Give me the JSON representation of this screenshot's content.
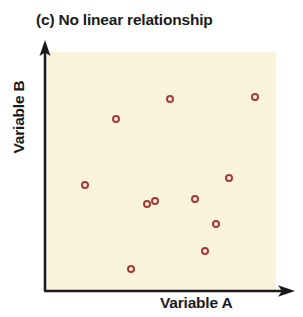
{
  "figure": {
    "title": "(c) No linear relationship",
    "panel_letter": "(c)",
    "xlabel": "Variable A",
    "ylabel": "Variable B",
    "plot_background_color": "#FAF3DC",
    "axis_color": "#1B1B1B",
    "marker_color": "#A33A3A",
    "title_color": "#1B1B1B"
  },
  "chart_data": {
    "type": "scatter",
    "title": "(c) No linear relationship",
    "xlabel": "Variable A",
    "ylabel": "Variable B",
    "grid": false,
    "legend": false,
    "xlim": [
      0,
      100
    ],
    "ylim": [
      0,
      100
    ],
    "xticks": [],
    "yticks": [],
    "marker_style": "open-circle",
    "marker_color": "#A33A3A",
    "series": [
      {
        "name": "Variable A vs Variable B",
        "points": [
          {
            "x": 30,
            "y": 72,
            "px": 116,
            "py": 119
          },
          {
            "x": 54,
            "y": 81,
            "px": 170,
            "py": 99
          },
          {
            "x": 91,
            "y": 81,
            "px": 255,
            "py": 97
          },
          {
            "x": 17,
            "y": 45,
            "px": 85,
            "py": 185
          },
          {
            "x": 44,
            "y": 36,
            "px": 147,
            "py": 204
          },
          {
            "x": 65,
            "y": 39,
            "px": 195,
            "py": 199
          },
          {
            "x": 80,
            "y": 47,
            "px": 229,
            "py": 178
          },
          {
            "x": 74,
            "y": 28,
            "px": 216,
            "py": 224
          },
          {
            "x": 69,
            "y": 17,
            "px": 205,
            "py": 251
          },
          {
            "x": 37,
            "y": 9,
            "px": 131,
            "py": 269
          },
          {
            "x": 47,
            "y": 37,
            "px": 155,
            "py": 201
          }
        ]
      }
    ],
    "annotation": "Points are scattered with no discernible linear trend; correlation is approximately zero."
  }
}
